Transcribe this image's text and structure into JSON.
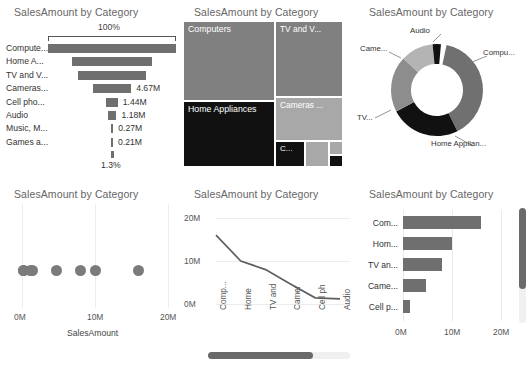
{
  "panels": {
    "funnel": {
      "title": "SalesAmount by Category"
    },
    "treemap": {
      "title": "SalesAmount by Category"
    },
    "donut": {
      "title": "SalesAmount by Category"
    },
    "scatter": {
      "title": "SalesAmount by Category"
    },
    "line": {
      "title": "SalesAmount by Category"
    },
    "bar": {
      "title": "SalesAmount by Category"
    }
  },
  "colors": {
    "bar_fill": "#6f6f6f",
    "dot_fill": "#7b7b7b",
    "dark_cell": "#111111",
    "mid_cell": "#808080",
    "light_cell": "#a8a8a8",
    "title_text": "#666666",
    "grid": "#ececec",
    "scrollbar_thumb": "#6a6a6a",
    "scrollbar_track": "#f0f0f0"
  },
  "chart_data": [
    {
      "id": "funnel",
      "type": "bar",
      "title": "SalesAmount by Category",
      "subtype": "funnel",
      "top_axis_label": "100%",
      "bottom_label": "1.3%",
      "xlabel": "",
      "ylabel": "",
      "categories": [
        "Compute...",
        "Home A...",
        "TV and V...",
        "Cameras...",
        "Cell pho...",
        "Audio",
        "Music, M...",
        "Games a..."
      ],
      "full_categories": [
        "Computers",
        "Home Appliances",
        "TV and Video",
        "Cameras and camcorders",
        "Cell phones",
        "Audio",
        "Music, Movies and Audio Books",
        "Games and Toys"
      ],
      "values": [
        16.0,
        10.0,
        8.0,
        4.67,
        1.44,
        1.18,
        0.27,
        0.21
      ],
      "value_labels": [
        "",
        "",
        "",
        "4.67M",
        "1.44M",
        "1.18M",
        "0.27M",
        "0.21M"
      ],
      "widths_pct": [
        100,
        62,
        53,
        30,
        9,
        7,
        2,
        1.4
      ]
    },
    {
      "id": "treemap",
      "type": "heatmap",
      "subtype": "treemap",
      "title": "SalesAmount by Category",
      "categories": [
        "Computers",
        "Home Appliances",
        "TV and V...",
        "Cameras ...",
        "C...",
        "",
        "",
        ""
      ],
      "values": [
        16.0,
        10.0,
        8.0,
        4.67,
        1.44,
        1.18,
        0.27,
        0.21
      ]
    },
    {
      "id": "donut",
      "type": "pie",
      "subtype": "donut",
      "title": "SalesAmount by Category",
      "labels": [
        "Compu...",
        "Home Applian...",
        "TV...",
        "Came...",
        "Audio"
      ],
      "values": [
        16.0,
        10.0,
        8.0,
        4.67,
        1.18
      ],
      "legend_position": "callout"
    },
    {
      "id": "scatter",
      "type": "scatter",
      "title": "SalesAmount by Category",
      "xlabel": "SalesAmount",
      "ylabel": "",
      "xticks": [
        "0M",
        "10M",
        "20M"
      ],
      "xtick_values": [
        0,
        10,
        20
      ],
      "xlim": [
        0,
        20
      ],
      "x": [
        0.2,
        0.27,
        1.18,
        1.44,
        4.67,
        8.0,
        10.0,
        16.0
      ],
      "y": [
        0,
        0,
        0,
        0,
        0,
        0,
        0,
        0
      ]
    },
    {
      "id": "line",
      "type": "line",
      "title": "SalesAmount by Category",
      "categories": [
        "Comp...",
        "Home",
        "TV and",
        "Camer",
        "Cell ph",
        "Audio"
      ],
      "values": [
        16.0,
        10.0,
        8.0,
        4.67,
        1.44,
        1.18
      ],
      "yticks": [
        "0M",
        "10M",
        "20M"
      ],
      "ytick_values": [
        0,
        10,
        20
      ],
      "ylim": [
        0,
        20
      ],
      "xlabel": "",
      "ylabel": "",
      "has_scrollbar": true,
      "scrollbar_fill_pct": 74
    },
    {
      "id": "bar",
      "type": "bar",
      "title": "SalesAmount by Category",
      "orientation": "horizontal",
      "categories": [
        "Com...",
        "Hom...",
        "TV an...",
        "Came...",
        "Cell p..."
      ],
      "full_categories": [
        "Computers",
        "Home Appliances",
        "TV and Video",
        "Cameras and camcorders",
        "Cell phones"
      ],
      "values": [
        16.0,
        10.0,
        8.0,
        4.67,
        1.44
      ],
      "xticks": [
        "0M",
        "10M",
        "20M"
      ],
      "xtick_values": [
        0,
        10,
        20
      ],
      "xlim": [
        0,
        20
      ],
      "has_scrollbar": true,
      "scrollbar_fill_pct": 70
    }
  ]
}
